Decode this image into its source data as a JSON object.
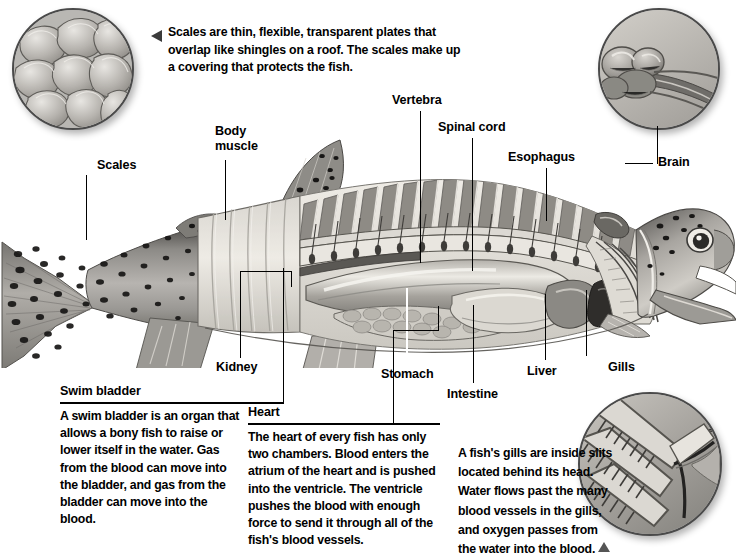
{
  "page": {
    "background": "#ffffff",
    "ink": "#000000"
  },
  "top_note": {
    "marker": "triangle-left",
    "text": "Scales are thin, flexible, transparent plates that overlap like shingles on a roof. The scales make up a covering that protects the fish."
  },
  "insets": [
    {
      "id": "scales-inset",
      "caption_ref": "top_note",
      "depicts": "overlapping fish scales magnified"
    },
    {
      "id": "brain-inset",
      "caption_ref": "label-brain",
      "depicts": "fish brain close-up"
    },
    {
      "id": "gills-inset",
      "caption_ref": "gills_note",
      "depicts": "gill filaments and blood vessels close-up"
    }
  ],
  "labels": [
    {
      "name": "scales",
      "text": "Scales"
    },
    {
      "name": "body-muscle",
      "text": "Body\nmuscle"
    },
    {
      "name": "vertebra",
      "text": "Vertebra"
    },
    {
      "name": "spinal-cord",
      "text": "Spinal cord"
    },
    {
      "name": "esophagus",
      "text": "Esophagus"
    },
    {
      "name": "brain",
      "text": "Brain"
    },
    {
      "name": "kidney",
      "text": "Kidney"
    },
    {
      "name": "stomach",
      "text": "Stomach"
    },
    {
      "name": "intestine",
      "text": "Intestine"
    },
    {
      "name": "liver",
      "text": "Liver"
    },
    {
      "name": "gills",
      "text": "Gills"
    }
  ],
  "blocks": [
    {
      "name": "swim-bladder",
      "heading": "Swim bladder",
      "body": "A swim bladder is an organ that allows a bony fish to raise or lower itself in the water. Gas from the blood can move into the bladder, and gas from the bladder can move into the blood."
    },
    {
      "name": "heart",
      "heading": "Heart",
      "body": "The heart of every fish has only two chambers. Blood enters the atrium of the heart and is pushed into the ventricle. The ventricle pushes the blood with enough force to send it through all of the fish's blood vessels."
    }
  ],
  "gills_note": {
    "text": "A fish's gills are inside slits located behind its head. Water flows past the many blood vessels in the gills, and oxygen passes from the water into the blood.",
    "marker": "triangle-up"
  },
  "colors": {
    "ink": "#000000",
    "rule": "#000000",
    "marker": "#3b3b3b",
    "inset_border": "#4a4a4a",
    "fish_light": "#e4e1dc",
    "fish_mid": "#a9a7a3",
    "fish_dark": "#6d6b68",
    "fish_darkest": "#3a3937"
  }
}
